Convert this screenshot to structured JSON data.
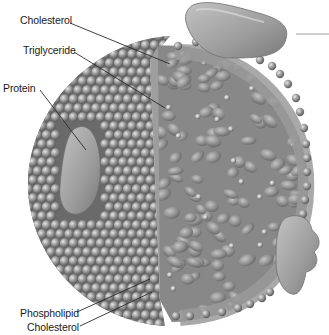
{
  "diagram": {
    "labels": {
      "cholesterol_top": "Cholesterol",
      "triglyceride": "Triglyceride",
      "protein": "Protein",
      "phospholipid": "Phospholipid",
      "cholesterol_bottom": "Cholesterol"
    },
    "colors": {
      "background": "#ffffff",
      "sphere_dark": "#6e6e6e",
      "sphere_mid": "#9a9a9a",
      "sphere_light": "#d0d0d0",
      "core_fill": "#8a8a8a",
      "protein_fill": "#a8a8a8",
      "leader_line": "#2a2a2a",
      "label_text": "#1a1a1a"
    }
  }
}
